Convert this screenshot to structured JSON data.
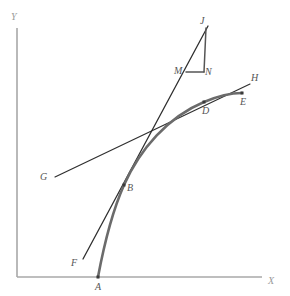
{
  "figure": {
    "type": "geometry-diagram",
    "width": 290,
    "height": 296,
    "background_color": "#ffffff"
  },
  "axes": {
    "x_label": "X",
    "y_label": "Y",
    "axis_color": "#a8a8a8",
    "origin": {
      "x": 17,
      "y": 277
    },
    "x_end": {
      "x": 262,
      "y": 277
    },
    "y_end": {
      "x": 17,
      "y": 28
    },
    "x_label_pos": {
      "x": 268,
      "y": 276
    },
    "y_label_pos": {
      "x": 11,
      "y": 12
    }
  },
  "curve": {
    "name": "curve-AE",
    "color": "#6b6b6b",
    "stroke_width": 2.6,
    "path": "M 98 277 C 104 245, 112 212, 124 185 C 140 149, 168 117, 204 102 C 218 96, 232 93, 242 93",
    "endpoints": [
      "A",
      "E"
    ]
  },
  "lines": [
    {
      "name": "secant-GH",
      "label_from": "G",
      "label_to": "H",
      "color": "#2f2f2f",
      "from": {
        "x": 55,
        "y": 177
      },
      "to": {
        "x": 250,
        "y": 84
      }
    },
    {
      "name": "chord-FJ",
      "label_from": "F",
      "label_to": "J",
      "color": "#2f2f2f",
      "from": {
        "x": 83,
        "y": 259
      },
      "to": {
        "x": 208,
        "y": 26
      }
    }
  ],
  "triangle": {
    "name": "slope-triangle-JMN",
    "vertices": [
      "J",
      "M",
      "N"
    ],
    "color": "#555555",
    "J": {
      "x": 208,
      "y": 26
    },
    "M": {
      "x": 186,
      "y": 72
    },
    "N": {
      "x": 204,
      "y": 72
    }
  },
  "points": [
    {
      "id": "A",
      "label": "A",
      "x": 98,
      "y": 277,
      "dot": true,
      "label_x": 95,
      "label_y": 282
    },
    {
      "id": "B",
      "label": "B",
      "x": 124,
      "y": 185,
      "dot": true,
      "label_x": 127,
      "label_y": 183
    },
    {
      "id": "D",
      "label": "D",
      "x": 204,
      "y": 102,
      "dot": true,
      "label_x": 202,
      "label_y": 106
    },
    {
      "id": "E",
      "label": "E",
      "x": 242,
      "y": 93,
      "dot": true,
      "label_x": 240,
      "label_y": 97
    },
    {
      "id": "F",
      "label": "F",
      "x": 83,
      "y": 259,
      "dot": false,
      "label_x": 71,
      "label_y": 258
    },
    {
      "id": "G",
      "label": "G",
      "x": 55,
      "y": 177,
      "dot": false,
      "label_x": 40,
      "label_y": 172
    },
    {
      "id": "H",
      "label": "H",
      "x": 250,
      "y": 84,
      "dot": false,
      "label_x": 251,
      "label_y": 73
    },
    {
      "id": "J",
      "label": "J",
      "x": 208,
      "y": 26,
      "dot": false,
      "label_x": 200,
      "label_y": 16
    },
    {
      "id": "M",
      "label": "M",
      "x": 186,
      "y": 72,
      "dot": false,
      "label_x": 174,
      "label_y": 66
    },
    {
      "id": "N",
      "label": "N",
      "x": 204,
      "y": 72,
      "dot": false,
      "label_x": 205,
      "label_y": 67
    }
  ]
}
